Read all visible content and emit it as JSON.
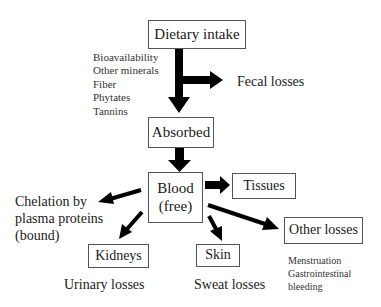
{
  "nodes": {
    "dietary_intake": "Dietary intake",
    "absorbed": "Absorbed",
    "blood_line1": "Blood",
    "blood_line2": "(free)",
    "tissues": "Tissues",
    "kidneys": "Kidneys",
    "skin": "Skin",
    "other_losses": "Other losses"
  },
  "labels": {
    "inhibitors": [
      "Bioavailability",
      "Other minerals",
      "Fiber",
      "Phytates",
      "Tannins"
    ],
    "fecal_losses": "Fecal losses",
    "chelation": [
      "Chelation by",
      "plasma proteins",
      "(bound)"
    ],
    "urinary_losses": "Urinary losses",
    "sweat_losses": "Sweat losses",
    "other_losses_causes": [
      "Menstruation",
      "Gastrointestinal",
      "bleeding"
    ]
  }
}
